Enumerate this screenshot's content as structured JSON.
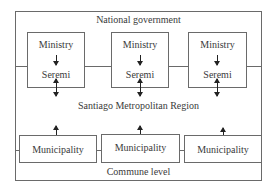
{
  "diagram": {
    "national_label": "National government",
    "regional_label": "Santiago Metropolitan Region",
    "commune_label": "Commune level",
    "ministry_boxes": [
      {
        "top": "Ministry",
        "bottom": "Seremi"
      },
      {
        "top": "Ministry",
        "bottom": "Seremi"
      },
      {
        "top": "Ministry",
        "bottom": "Seremi"
      }
    ],
    "municipality_boxes": [
      {
        "label": "Municipality"
      },
      {
        "label": "Municipality"
      },
      {
        "label": "Municipality"
      }
    ]
  }
}
